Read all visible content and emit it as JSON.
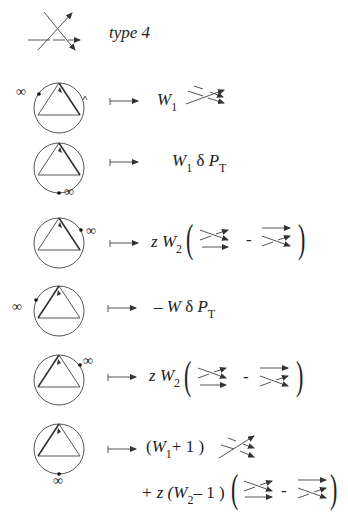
{
  "header": {
    "crossing_label": "type 4"
  },
  "symbols": {
    "infinity": "∞",
    "minus": "-",
    "delta": "δ"
  },
  "rows": [
    {
      "id": "row1",
      "W": "W",
      "W_sub": "1"
    },
    {
      "id": "row2",
      "W": "W",
      "W_sub": "1",
      "delta": "δ",
      "P": "P",
      "P_sub": "T"
    },
    {
      "id": "row3",
      "z": "z",
      "W": "W",
      "W_sub": "2",
      "minus": "-"
    },
    {
      "id": "row4",
      "prefix": "– W",
      "delta": "δ",
      "P": "P",
      "P_sub": "T"
    },
    {
      "id": "row5",
      "z": "z",
      "W": "W",
      "W_sub": "2",
      "minus": "-"
    },
    {
      "id": "row6",
      "line1_open": "(",
      "W": "W",
      "W_sub": "1",
      "line1_rest": "+ 1 )",
      "line2_prefix": "+ z (",
      "W2": "W",
      "W2_sub": "2",
      "line2_rest": "– 1 )",
      "minus": "-"
    }
  ]
}
